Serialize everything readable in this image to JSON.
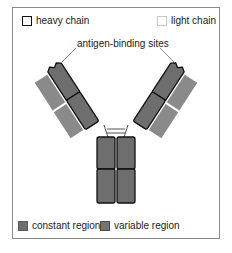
{
  "legend_top": {
    "heavy_chain": "heavy chain",
    "light_chain": "light chain"
  },
  "annotation": {
    "antigen_binding_sites": "antigen-binding sites"
  },
  "legend_bottom": {
    "constant_region": "constant region",
    "variable_region": "variable region"
  },
  "colors": {
    "heavy_fill": "#6e6e6e",
    "heavy_outline": "#111111",
    "light_fill": "#8a8a8a",
    "frame_border": "#8a8a8a"
  }
}
